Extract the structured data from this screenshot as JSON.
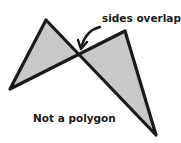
{
  "diagram": {
    "annotation_label": "sides overlap",
    "caption": "Not a polygon",
    "colors": {
      "fill": "#c8c8c8",
      "stroke": "#1a1a1a",
      "background": "#ffffff"
    },
    "shape": {
      "description": "bow-tie figure with two crossing sides",
      "vertices": [
        [
          46,
          20
        ],
        [
          156,
          135
        ],
        [
          125,
          31
        ],
        [
          10,
          89
        ]
      ],
      "crossing_point": [
        79,
        55
      ]
    }
  }
}
